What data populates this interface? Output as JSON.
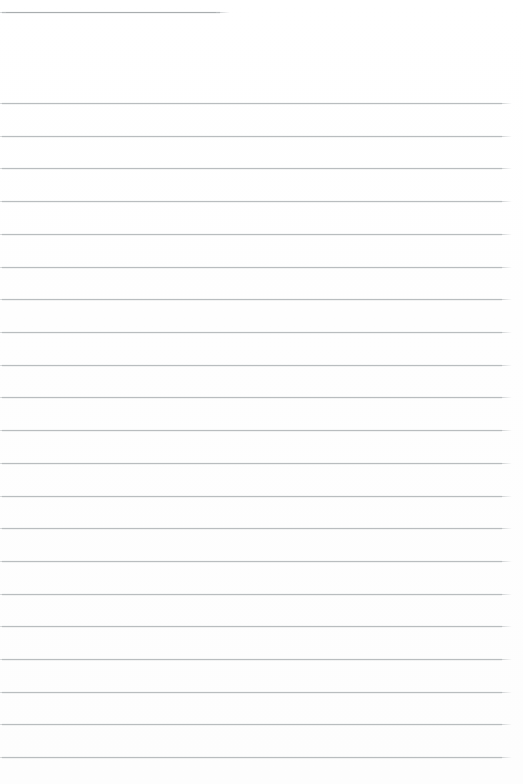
{
  "page": {
    "width": 523,
    "height": 784,
    "background_color": "#ffffff",
    "rule_color": "#b9bdbf",
    "header_rule_color": "#a9adaf",
    "content_text": "",
    "notes_text": ""
  },
  "header_rule": {
    "name": "header-rule",
    "x": 2,
    "y": 12,
    "width": 218,
    "thickness": 1,
    "label": ""
  },
  "ruling": {
    "first_line_y": 103,
    "pitch": 32.7,
    "left_x": 2,
    "right_x": 502,
    "width": 500,
    "thickness": 1,
    "count": 21,
    "lines": [
      {
        "index": 1,
        "y": 103,
        "text": ""
      },
      {
        "index": 2,
        "y": 136,
        "text": ""
      },
      {
        "index": 3,
        "y": 168,
        "text": ""
      },
      {
        "index": 4,
        "y": 201,
        "text": ""
      },
      {
        "index": 5,
        "y": 234,
        "text": ""
      },
      {
        "index": 6,
        "y": 267,
        "text": ""
      },
      {
        "index": 7,
        "y": 299,
        "text": ""
      },
      {
        "index": 8,
        "y": 332,
        "text": ""
      },
      {
        "index": 9,
        "y": 365,
        "text": ""
      },
      {
        "index": 10,
        "y": 397,
        "text": ""
      },
      {
        "index": 11,
        "y": 430,
        "text": ""
      },
      {
        "index": 12,
        "y": 463,
        "text": ""
      },
      {
        "index": 13,
        "y": 496,
        "text": ""
      },
      {
        "index": 14,
        "y": 528,
        "text": ""
      },
      {
        "index": 15,
        "y": 561,
        "text": ""
      },
      {
        "index": 16,
        "y": 594,
        "text": ""
      },
      {
        "index": 17,
        "y": 626,
        "text": ""
      },
      {
        "index": 18,
        "y": 659,
        "text": ""
      },
      {
        "index": 19,
        "y": 692,
        "text": ""
      },
      {
        "index": 20,
        "y": 724,
        "text": ""
      },
      {
        "index": 21,
        "y": 757,
        "text": ""
      }
    ]
  }
}
